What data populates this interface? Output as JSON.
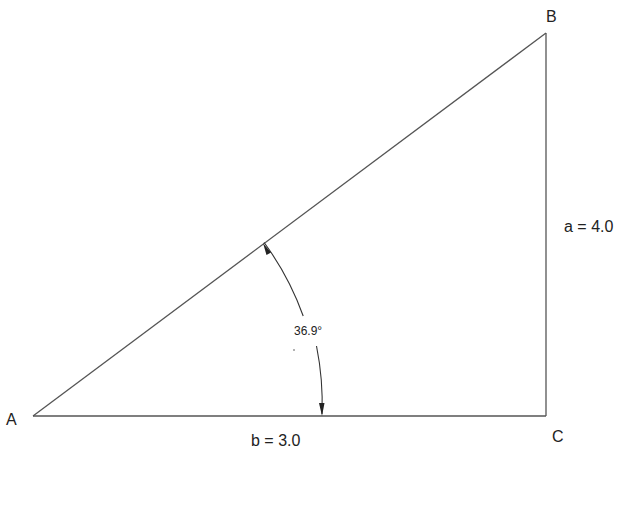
{
  "diagram": {
    "type": "right-triangle",
    "vertices": [
      {
        "id": "A",
        "label": "A",
        "x": 33,
        "y": 416
      },
      {
        "id": "B",
        "label": "B",
        "x": 546,
        "y": 33
      },
      {
        "id": "C",
        "label": "C",
        "x": 546,
        "y": 416
      }
    ],
    "sides": {
      "a": {
        "label": "a = 4.0",
        "from": "B",
        "to": "C",
        "length": 4.0
      },
      "b": {
        "label": "b = 3.0",
        "from": "A",
        "to": "C",
        "length": 3.0
      }
    },
    "angle": {
      "vertex": "A",
      "label": "36.9°",
      "degrees": 36.9,
      "arc_radius": 289
    },
    "colors": {
      "background": "#ffffff",
      "line": "#555555",
      "text": "#222222"
    }
  }
}
